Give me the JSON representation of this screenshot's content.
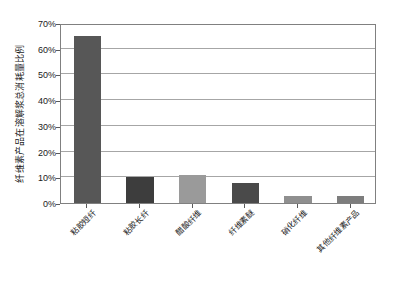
{
  "chart_data": {
    "type": "bar",
    "title": "",
    "subtitle": "",
    "xlabel": "",
    "ylabel": "纤维素产品在溶解浆总消耗量比例",
    "categories": [
      "粘胶短纤",
      "粘胶长纤",
      "醋酸纤维",
      "纤维素醚",
      "硝化纤维",
      "其他纤维素产品"
    ],
    "values": [
      64.8,
      10.0,
      10.8,
      7.8,
      2.9,
      2.9
    ],
    "value_labels": [
      "64.8%",
      "10.0%",
      "10.8%",
      "7.8%",
      "2.9%",
      "2.9%"
    ],
    "bar_colors": [
      "#575757",
      "#3d3d3d",
      "#9a9a9a",
      "#4a4a4a",
      "#8f8f8f",
      "#7d7d7d"
    ],
    "ylim": [
      0,
      70
    ],
    "ytick_values": [
      0,
      10,
      20,
      30,
      40,
      50,
      60,
      70
    ],
    "ytick_labels": [
      "0%",
      "10%",
      "20%",
      "30%",
      "40%",
      "50%",
      "60%",
      "70%"
    ],
    "grid": true,
    "grid_axis": "y",
    "legend": false,
    "legend_position": "none",
    "axis_color": "#808080",
    "grid_color": "#a6a6a6",
    "text_color": "#1a1a1a",
    "plot_background": "#ffffff"
  }
}
